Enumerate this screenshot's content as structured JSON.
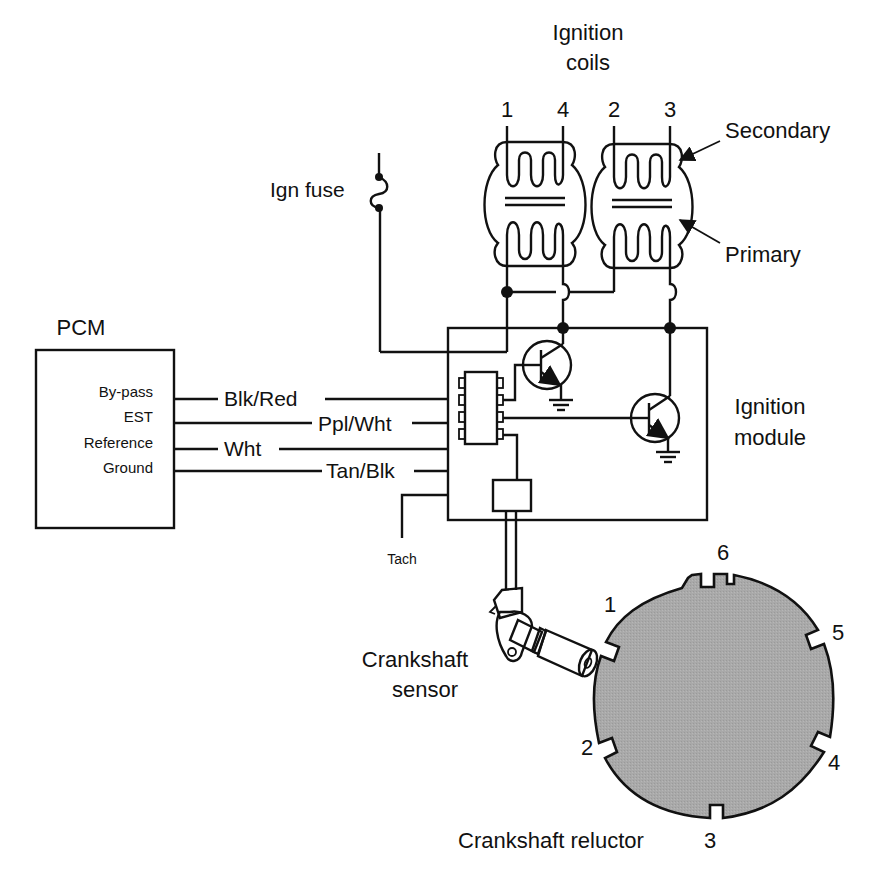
{
  "title": {
    "ignition_coils_line1": "Ignition",
    "ignition_coils_line2": "coils"
  },
  "coil_leads": [
    {
      "label": "1",
      "x": 507
    },
    {
      "label": "4",
      "x": 563
    },
    {
      "label": "2",
      "x": 614
    },
    {
      "label": "3",
      "x": 670
    }
  ],
  "coil_annotations": {
    "secondary": "Secondary",
    "primary": "Primary"
  },
  "fuse": {
    "label": "Ign fuse"
  },
  "pcm": {
    "title": "PCM",
    "pins": [
      "By-pass",
      "EST",
      "Reference",
      "Ground"
    ]
  },
  "wires": [
    {
      "label": "Blk/Red",
      "pin": "By-pass"
    },
    {
      "label": "Ppl/Wht",
      "pin": "EST"
    },
    {
      "label": "Wht",
      "pin": "Reference"
    },
    {
      "label": "Tan/Blk",
      "pin": "Ground"
    }
  ],
  "ignition_module": {
    "label_line1": "Ignition",
    "label_line2": "module"
  },
  "tach": {
    "label": "Tach"
  },
  "sensor": {
    "label_line1": "Crankshaft",
    "label_line2": "sensor"
  },
  "reluctor": {
    "label": "Crankshaft reluctor",
    "notch_labels": [
      "1",
      "2",
      "3",
      "4",
      "5",
      "6"
    ],
    "fill_color": "#a9a9a9"
  },
  "colors": {
    "line": "#111111",
    "background": "#ffffff",
    "reluctor_fill": "#a9a9a9"
  }
}
